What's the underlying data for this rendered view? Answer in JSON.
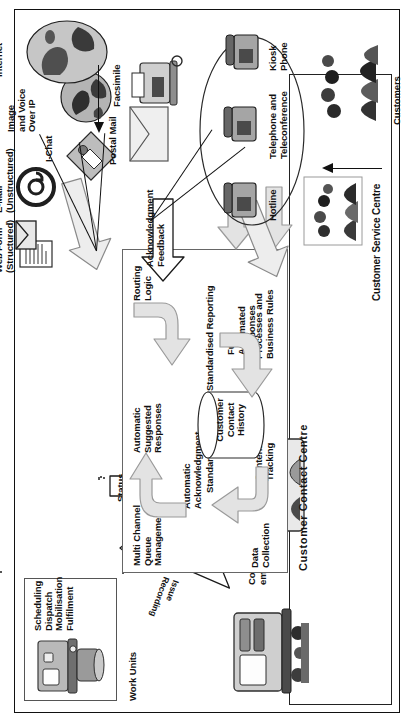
{
  "figure": {
    "orientation": "rotated-90-ccw"
  },
  "actors": {
    "council_employees": "Council\nemployees",
    "customer_service_representative": "Customer\nService\nRepresentative",
    "customers": "Customers",
    "internet": "Internet"
  },
  "work_units": {
    "title": "Work Units",
    "box_lines": "Scheduling\nDispatch\nMobilisation\nFulfilment"
  },
  "zones": {
    "contact_centre": "Customer Contact Centre",
    "service_centre": "Customer Service Centre"
  },
  "flow_arrows": {
    "issue_recording": "Issue\nRecording",
    "personalised_service": "Personalised\nService",
    "workflow": "Workflow",
    "status_update": "Status\nUpdate",
    "acknowledgment_feedback": "Acknowledgment\nFeedback"
  },
  "contact_centre_nodes": {
    "multi_channel_queue_management": "Multi Channel\nQueue\nManagement",
    "automatic_suggested_responses": "Automatic\nSuggested\nResponses",
    "routing_logic": "Routing\nLogic",
    "automatic_acknowledgment": "Automatic\nAcknowledgment",
    "standardised_handling": "Standardised Handling",
    "customer_contact_history": "Customer\nContact\nHistory",
    "standardised_reporting": "Standardised Reporting",
    "fully_automated_responses": "Fully\nAutomated\nResponses",
    "data_collection": "Data\nCollection",
    "content_tracking": "Content\nTracking",
    "processes_and_business_rules": "Processes and\nBusiness Rules"
  },
  "channels": {
    "web_form": "Web Form\n(Structured)",
    "email": "E-Mail\n(Unstructured)",
    "ichat": "I-Chat",
    "image_voice_over_ip": "Image\nand Voice\nOver IP",
    "postal_mail": "Postal Mail",
    "facsimile": "Facsimile",
    "telephone_teleconference": "Telephone and\nTeleconference",
    "kiosk_phone": "Kiosk\nPhone",
    "hotline": "Hotline"
  },
  "colors": {
    "ink": "#111111",
    "arrow_fill": "#e3e3e3",
    "arrow_stroke": "#8a8a8a",
    "box_stroke": "#555555",
    "art_dark": "#3a3a3a",
    "art_mid": "#808080",
    "art_light": "#cfcfcf"
  }
}
